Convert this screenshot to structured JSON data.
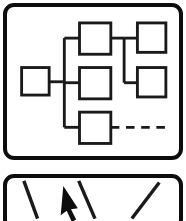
{
  "canvas": {
    "width": 186,
    "height": 221,
    "background": "#ffffff",
    "ink": "#0d0d0d"
  },
  "panels": [
    {
      "name": "diagram-panel",
      "icon_name": "flowchart-icon",
      "label": "Flowchart / block diagram icon",
      "frame": {
        "x": 3,
        "y": 3,
        "width": 180,
        "height": 157,
        "radius": 11,
        "stroke_width": 4
      }
    },
    {
      "name": "cursor-panel",
      "icon_name": "pointer-lines-icon",
      "label": "Arrow cursor over diagonal lines icon (cropped)",
      "frame": {
        "x": 3,
        "y": 174,
        "width": 180,
        "height": 56,
        "radius": 11,
        "stroke_width": 4
      }
    }
  ],
  "diagram": {
    "stroke": "#1a1a1a",
    "box_stroke_width": 3,
    "line_stroke_width": 3,
    "nodes": [
      {
        "id": "node-left",
        "name": "block-left",
        "x": 19,
        "y": 68,
        "width": 29,
        "height": 29
      },
      {
        "id": "node-top-center",
        "name": "block-top-center",
        "x": 80,
        "y": 21,
        "width": 33,
        "height": 33
      },
      {
        "id": "node-center",
        "name": "block-center",
        "x": 80,
        "y": 68,
        "width": 33,
        "height": 33
      },
      {
        "id": "node-bottom",
        "name": "block-bottom",
        "x": 80,
        "y": 115,
        "width": 33,
        "height": 33
      },
      {
        "id": "node-top-right",
        "name": "block-top-right",
        "x": 141,
        "y": 21,
        "width": 30,
        "height": 31
      },
      {
        "id": "node-mid-right",
        "name": "block-middle-right",
        "x": 141,
        "y": 68,
        "width": 30,
        "height": 31
      }
    ],
    "trunk": {
      "name": "vertical-trunk",
      "x": 64,
      "y1": 37,
      "y2": 131
    },
    "edges": [
      {
        "name": "edge-left-to-trunk",
        "points": [
          [
            48,
            83
          ],
          [
            64,
            83
          ]
        ]
      },
      {
        "name": "edge-trunk-to-top-center",
        "points": [
          [
            64,
            37
          ],
          [
            80,
            37
          ]
        ]
      },
      {
        "name": "edge-trunk-to-center",
        "points": [
          [
            64,
            84
          ],
          [
            80,
            84
          ]
        ]
      },
      {
        "name": "edge-trunk-to-bottom",
        "points": [
          [
            64,
            131
          ],
          [
            80,
            131
          ]
        ]
      },
      {
        "name": "edge-top-center-to-right",
        "points": [
          [
            113,
            37
          ],
          [
            127,
            37
          ]
        ]
      },
      {
        "name": "edge-right-riser",
        "points": [
          [
            127,
            37
          ],
          [
            127,
            84
          ]
        ]
      },
      {
        "name": "edge-right-to-top-right",
        "points": [
          [
            127,
            37
          ],
          [
            141,
            37
          ]
        ]
      },
      {
        "name": "edge-right-to-mid-right",
        "points": [
          [
            127,
            84
          ],
          [
            141,
            84
          ]
        ]
      }
    ],
    "dashed_edge": {
      "name": "edge-bottom-dashed",
      "points": [
        [
          113,
          131
        ],
        [
          170,
          131
        ]
      ],
      "dash_pattern": "9 7",
      "style": "dashed"
    }
  },
  "cursor_panel": {
    "stroke": "#1a1a1a",
    "line_stroke_width": 4,
    "lines": [
      {
        "name": "diagonal-line-1",
        "x1": 14,
        "y1": 8,
        "x2": 30,
        "y2": 52
      },
      {
        "name": "diagonal-line-2",
        "x1": 78,
        "y1": 8,
        "x2": 97,
        "y2": 52
      },
      {
        "name": "diagonal-line-3",
        "x1": 172,
        "y1": 10,
        "x2": 140,
        "y2": 52
      }
    ],
    "pointer": {
      "name": "mouse-pointer-icon",
      "fill": "#0d0d0d",
      "tip": [
        60,
        14
      ],
      "points": "60,14 57,48 64,43 70,56 75,53 69,41 77,40"
    }
  }
}
